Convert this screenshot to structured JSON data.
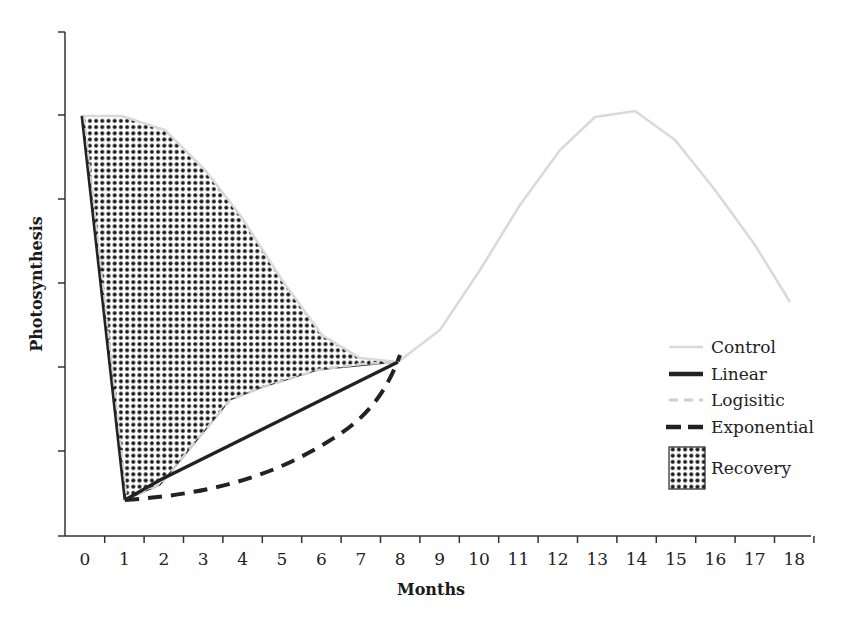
{
  "chart_data": {
    "type": "line",
    "title": "",
    "xlabel": "Months",
    "ylabel": "Photosynthesis",
    "x_ticks": [
      "0",
      "1",
      "2",
      "3",
      "4",
      "5",
      "6",
      "7",
      "8",
      "9",
      "10",
      "11",
      "12",
      "13",
      "14",
      "15",
      "16",
      "17",
      "18"
    ],
    "xlim": [
      0,
      18
    ],
    "ylim": [
      0,
      6
    ],
    "y_tick_labels_shown": false,
    "grid": false,
    "legend_position": "right",
    "units_note": "y values expressed in y-axis tick units (0 = x-axis, 6 = top tick)",
    "series": [
      {
        "name": "Control",
        "style": "light gray solid",
        "x": [
          0,
          1,
          2,
          3,
          4,
          5,
          6,
          7,
          8,
          9,
          10,
          11,
          12,
          13,
          14,
          15,
          16,
          17,
          17.8
        ],
        "y": [
          5.0,
          5.0,
          4.85,
          4.35,
          3.85,
          3.05,
          2.4,
          2.1,
          2.0,
          2.45,
          3.1,
          3.9,
          4.6,
          5.0,
          5.1,
          4.7,
          4.15,
          3.45,
          2.75
        ]
      },
      {
        "name": "Linear",
        "style": "black solid",
        "x": [
          1,
          2,
          8
        ],
        "y": [
          0.45,
          0.65,
          2.0
        ]
      },
      {
        "name": "Logisitic",
        "style": "light gray dashed",
        "x": [
          1,
          2,
          3,
          4,
          5,
          6,
          7,
          8
        ],
        "y": [
          0.45,
          0.7,
          1.2,
          1.7,
          1.85,
          1.95,
          2.0,
          2.0
        ]
      },
      {
        "name": "Exponential",
        "style": "black dashed",
        "x": [
          1,
          2,
          3,
          4,
          5,
          6,
          7,
          7.5,
          8
        ],
        "y": [
          0.45,
          0.55,
          0.72,
          0.9,
          1.1,
          1.35,
          1.7,
          1.95,
          2.1
        ]
      },
      {
        "name": "Recovery",
        "style": "dotted hatch fill",
        "description": "area between Control and Logisitic recovery from month 0 to 8"
      }
    ],
    "drop": {
      "from_month": 0,
      "to_month": 1,
      "from_value": 5.0,
      "to_value": 0.45
    }
  },
  "legend": {
    "items": [
      {
        "label": "Control"
      },
      {
        "label": "Linear"
      },
      {
        "label": "Logisitic"
      },
      {
        "label": "Exponential"
      },
      {
        "label": "Recovery"
      }
    ]
  },
  "axes": {
    "x_title": "Months",
    "y_title": "Photosynthesis"
  },
  "colors": {
    "control": "#d9d9d9",
    "linear": "#222222",
    "logistic": "#cfcfcf",
    "exponential": "#222222",
    "hatch": "#1e1e1e",
    "axis": "#333333"
  }
}
